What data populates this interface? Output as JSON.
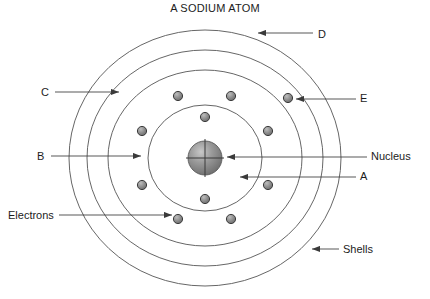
{
  "title": "A SODIUM ATOM",
  "element_name": "sodium",
  "diagram": {
    "type": "bohr-atom-model",
    "center": {
      "x": 205,
      "y": 158
    },
    "nucleus": {
      "label": "Nucleus",
      "radius": 17,
      "fill": "#8c8c8c",
      "stroke": "#4a4a4a",
      "crosshair": true
    },
    "shells": [
      {
        "name": "shell-1",
        "rx": 57,
        "ry": 53,
        "electron_count": 2
      },
      {
        "name": "shell-2",
        "rx": 97,
        "ry": 88,
        "electron_count": 8
      },
      {
        "name": "shell-3",
        "rx": 118,
        "ry": 108,
        "electron_count": 1
      },
      {
        "name": "shell-4",
        "rx": 136,
        "ry": 128,
        "electron_count": 0
      }
    ],
    "electron_config": "2, 8, 1",
    "electron": {
      "label": "Electrons",
      "radius": 4.6,
      "fill": "#909090",
      "stroke": "#3c3c3c"
    },
    "shell_stroke": "#555555",
    "electron_positions": [
      {
        "shell": 1,
        "x": 205,
        "y": 117
      },
      {
        "shell": 1,
        "x": 205,
        "y": 199
      },
      {
        "shell": 2,
        "x": 178,
        "y": 96
      },
      {
        "shell": 2,
        "x": 231,
        "y": 96
      },
      {
        "shell": 2,
        "x": 142,
        "y": 131
      },
      {
        "shell": 2,
        "x": 268,
        "y": 131
      },
      {
        "shell": 2,
        "x": 142,
        "y": 185
      },
      {
        "shell": 2,
        "x": 268,
        "y": 185
      },
      {
        "shell": 2,
        "x": 178,
        "y": 219
      },
      {
        "shell": 2,
        "x": 231,
        "y": 219
      },
      {
        "shell": 3,
        "x": 288,
        "y": 98
      }
    ]
  },
  "callouts": [
    {
      "id": "D",
      "label": "D",
      "side": "right",
      "points_to": "outermost-shell"
    },
    {
      "id": "E",
      "label": "E",
      "side": "right",
      "points_to": "outer-electron"
    },
    {
      "id": "Nucleus",
      "label": "Nucleus",
      "side": "right",
      "points_to": "nucleus"
    },
    {
      "id": "A",
      "label": "A",
      "side": "right",
      "points_to": "inner-shell"
    },
    {
      "id": "Shells",
      "label": "Shells",
      "side": "right",
      "points_to": "shell-ring"
    },
    {
      "id": "C",
      "label": "C",
      "side": "left",
      "points_to": "third-shell"
    },
    {
      "id": "B",
      "label": "B",
      "side": "left",
      "points_to": "second-shell"
    },
    {
      "id": "Electrons",
      "label": "Electrons",
      "side": "left",
      "points_to": "electron"
    }
  ],
  "colors": {
    "background": "#ffffff",
    "ink": "#1c1c1c",
    "line": "#555555",
    "electron_fill": "#909090",
    "nucleus_fill": "#8c8c8c"
  }
}
